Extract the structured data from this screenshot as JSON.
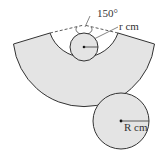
{
  "diagram": {
    "angle_label": "150°",
    "small_radius_label": "r cm",
    "small_radius_var": "r",
    "large_radius_label": "R cm",
    "large_radius_var": "R",
    "unit": "cm",
    "colors": {
      "fill": "#e4e4e4",
      "stroke": "#333333",
      "background": "#ffffff"
    }
  }
}
